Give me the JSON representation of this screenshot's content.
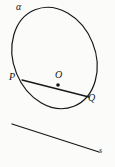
{
  "figure": {
    "background_color": "#fbfbfa",
    "ink_color": "#17171a",
    "labels": {
      "ellipse": "α",
      "chord_start_point": "P",
      "center_point": "O",
      "chord_end_point": "Q",
      "line": "s"
    },
    "geometry": {
      "ellipse": {
        "center_x": 54.5,
        "center_y": 58,
        "radius_x": 41,
        "radius_y": 52,
        "rotation_deg": -22,
        "stroke_width": 1.2
      },
      "chord": {
        "x1": 22,
        "y1": 80,
        "x2": 89,
        "y2": 97,
        "stroke_width": 1.3
      },
      "center_dot": {
        "cx": 58,
        "cy": 85,
        "r": 1.8
      },
      "line": {
        "x1": 12,
        "y1": 124,
        "x2": 99,
        "y2": 152,
        "stroke_width": 1.3
      }
    }
  }
}
